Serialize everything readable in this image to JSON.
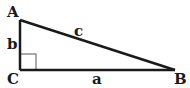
{
  "diagram": {
    "vertices": {
      "A": "A",
      "B": "B",
      "C": "C"
    },
    "sides": {
      "a": "a",
      "b": "b",
      "c": "c"
    },
    "right_angle_at": "C",
    "colors": {
      "line": "#1a1a1a",
      "right_angle_marker": "#555555",
      "background": "#ffffff"
    }
  }
}
